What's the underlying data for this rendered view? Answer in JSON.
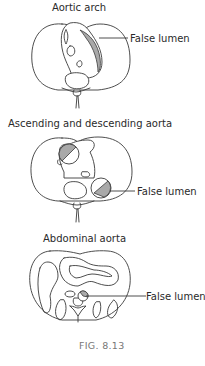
{
  "figure": {
    "caption": "FIG. 8.13",
    "panels": [
      {
        "title": "Aortic arch",
        "label": "False lumen"
      },
      {
        "title": "Ascending and descending aorta",
        "label": "False lumen"
      },
      {
        "title": "Abdominal aorta",
        "label": "False lumen"
      }
    ]
  },
  "colors": {
    "outline": "#3a3a3a",
    "false_lumen_fill": "#a9a9a9",
    "caption": "#777777"
  }
}
